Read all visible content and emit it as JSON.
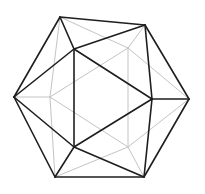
{
  "diagram": {
    "shape": "icosahedron",
    "colors": {
      "front_edge": "#1e1e1e",
      "back_edge": "#c4c4c4",
      "background": "#ffffff"
    },
    "vertices": {
      "A": [
        60,
        17
      ],
      "B": [
        145,
        25
      ],
      "C": [
        14,
        97
      ],
      "D": [
        74,
        49
      ],
      "E": [
        152,
        99
      ],
      "F": [
        189,
        99
      ],
      "G": [
        74,
        147
      ],
      "H": [
        55,
        177
      ],
      "I": [
        144,
        177
      ],
      "J": [
        128,
        48
      ],
      "K": [
        50,
        97
      ],
      "L": [
        128,
        147
      ]
    },
    "front_edges": [
      [
        "A",
        "B"
      ],
      [
        "A",
        "C"
      ],
      [
        "A",
        "D"
      ],
      [
        "B",
        "D"
      ],
      [
        "B",
        "E"
      ],
      [
        "B",
        "F"
      ],
      [
        "C",
        "D"
      ],
      [
        "C",
        "G"
      ],
      [
        "C",
        "H"
      ],
      [
        "D",
        "E"
      ],
      [
        "D",
        "G"
      ],
      [
        "E",
        "G"
      ],
      [
        "E",
        "F"
      ],
      [
        "E",
        "I"
      ],
      [
        "F",
        "I"
      ],
      [
        "G",
        "H"
      ],
      [
        "G",
        "I"
      ],
      [
        "H",
        "I"
      ]
    ],
    "back_edges": [
      [
        "A",
        "J"
      ],
      [
        "B",
        "J"
      ],
      [
        "J",
        "F"
      ],
      [
        "J",
        "K"
      ],
      [
        "J",
        "L"
      ],
      [
        "K",
        "A"
      ],
      [
        "K",
        "C"
      ],
      [
        "K",
        "H"
      ],
      [
        "K",
        "L"
      ],
      [
        "L",
        "H"
      ],
      [
        "L",
        "I"
      ],
      [
        "L",
        "F"
      ]
    ]
  }
}
